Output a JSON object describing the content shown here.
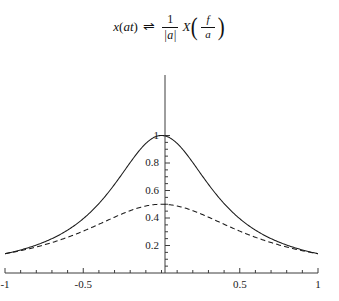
{
  "formula": {
    "lhs_fn": "x",
    "lhs_open": "(",
    "lhs_arg_a": "a",
    "lhs_arg_t": "t",
    "lhs_close": ")",
    "relation": "⇌",
    "coef_num": "1",
    "coef_den": "|a|",
    "rhs_fn": "X",
    "rhs_open": "(",
    "rhs_num": "f",
    "rhs_den": "a",
    "rhs_close": ")",
    "plain": "x(at) ⇌ 1/|a| X(f/a)"
  },
  "chart_data": {
    "type": "line",
    "title": "",
    "xlabel": "",
    "ylabel": "",
    "xlim": [
      -1,
      1
    ],
    "ylim": [
      0,
      1.05
    ],
    "grid": false,
    "legend": "none",
    "x_ticks": [
      -1,
      -0.5,
      0.5,
      1
    ],
    "x_tick_labels": [
      "-1",
      "-0.5",
      "0.5",
      "1"
    ],
    "x_minor_tick_step": 0.1,
    "y_ticks": [
      0.2,
      0.4,
      0.6,
      0.8,
      1
    ],
    "y_tick_labels": [
      "0.2",
      "0.4",
      "0.6",
      "0.8",
      "1"
    ],
    "y_minor_tick_step": 0.05,
    "axis_color": "#3c3c3c",
    "series": [
      {
        "name": "narrow-pulse-solid",
        "style": "solid",
        "color": "#1a1a1a",
        "peak": 1.0,
        "half_width": 0.404,
        "x": [
          -1,
          -0.9,
          -0.8,
          -0.7,
          -0.6,
          -0.5,
          -0.4,
          -0.3,
          -0.2,
          -0.1,
          0,
          0.1,
          0.2,
          0.3,
          0.4,
          0.5,
          0.6,
          0.7,
          0.8,
          0.9,
          1
        ],
        "values": [
          0.14,
          0.168,
          0.203,
          0.25,
          0.312,
          0.395,
          0.505,
          0.645,
          0.803,
          0.942,
          1.0,
          0.942,
          0.803,
          0.645,
          0.505,
          0.395,
          0.312,
          0.25,
          0.203,
          0.168,
          0.14
        ]
      },
      {
        "name": "wide-pulse-dashed",
        "style": "dashed",
        "color": "#1a1a1a",
        "peak": 0.5,
        "half_width": 0.624,
        "x": [
          -1,
          -0.9,
          -0.8,
          -0.7,
          -0.6,
          -0.5,
          -0.4,
          -0.3,
          -0.2,
          -0.1,
          0,
          0.1,
          0.2,
          0.3,
          0.4,
          0.5,
          0.6,
          0.7,
          0.8,
          0.9,
          1
        ],
        "values": [
          0.14,
          0.163,
          0.191,
          0.224,
          0.262,
          0.305,
          0.351,
          0.397,
          0.438,
          0.47,
          0.5,
          0.47,
          0.438,
          0.397,
          0.351,
          0.305,
          0.262,
          0.224,
          0.191,
          0.163,
          0.14
        ]
      }
    ]
  }
}
